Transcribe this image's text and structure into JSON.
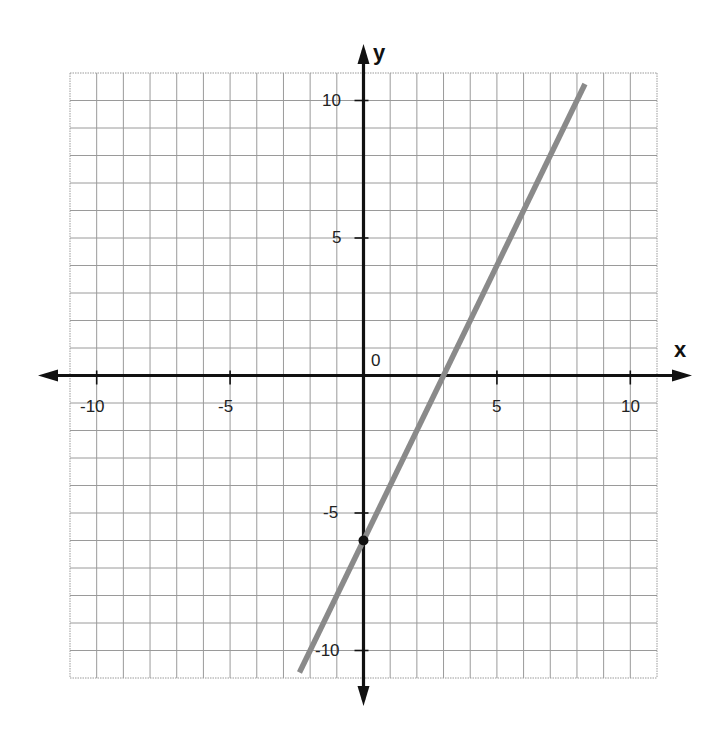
{
  "chart_data": {
    "type": "line",
    "title": "",
    "xlabel": "x",
    "ylabel": "y",
    "xlim": [
      -11,
      11
    ],
    "ylim": [
      -11,
      11
    ],
    "grid": true,
    "x_ticks": [
      -10,
      -5,
      0,
      5,
      10
    ],
    "y_ticks": [
      -10,
      -5,
      5,
      10
    ],
    "x_tick_labels": [
      "-10",
      "-5",
      "5",
      "10"
    ],
    "y_tick_labels": [
      "10",
      "5",
      "-5",
      "-10"
    ],
    "origin_label": "0",
    "series": [
      {
        "name": "line",
        "equation": "y = 2x - 6",
        "slope": 2,
        "intercept": -6,
        "x": [
          -2.5,
          8.5
        ],
        "y": [
          -11,
          11
        ],
        "color": "#8a8a8a"
      }
    ],
    "points": [
      {
        "label": "y-intercept",
        "x": 0,
        "y": -6,
        "color": "#111111"
      }
    ],
    "x_intercept": 3
  },
  "labels": {
    "x_axis": "x",
    "y_axis": "y",
    "origin": "0",
    "x_neg10": "-10",
    "x_neg5": "-5",
    "x_5": "5",
    "x_10": "10",
    "y_10": "10",
    "y_5": "5",
    "y_neg5": "-5",
    "y_neg10": "-10"
  },
  "colors": {
    "grid": "#9a9a9a",
    "axis": "#111111",
    "line": "#8a8a8a",
    "point": "#111111"
  }
}
